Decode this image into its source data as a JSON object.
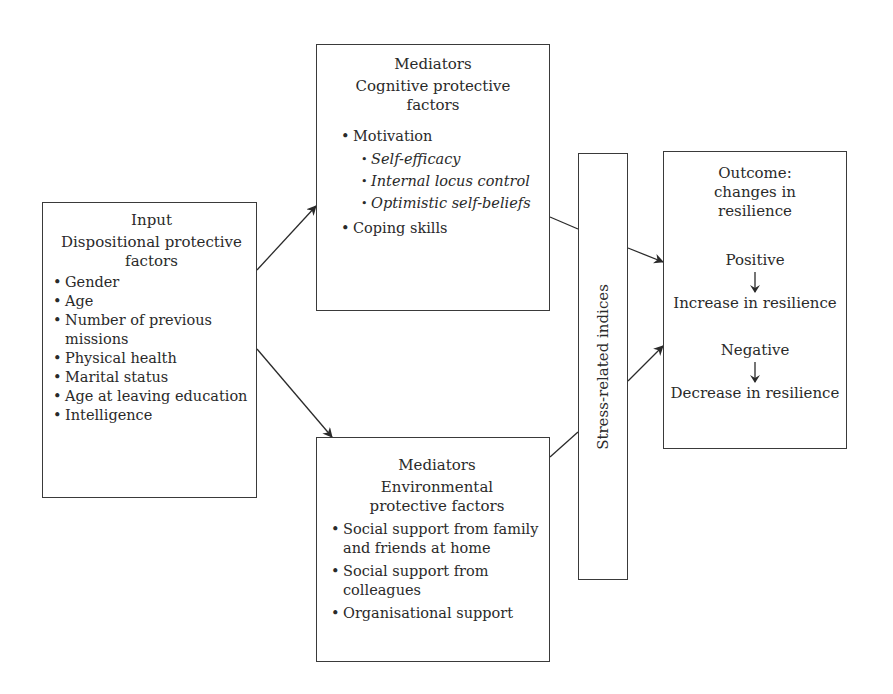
{
  "input": {
    "title": "Input",
    "subtitle": "Dispositional protective factors",
    "items": [
      "Gender",
      "Age",
      "Number of previous missions",
      "Physical health",
      "Marital status",
      "Age at leaving education",
      "Intelligence"
    ]
  },
  "cognitive": {
    "title": "Mediators",
    "subtitle": "Cognitive protective factors",
    "items": [
      {
        "label": "Motivation",
        "subitems": [
          "Self-efficacy",
          "Internal locus control",
          "Optimistic self-beliefs"
        ]
      },
      {
        "label": "Coping skills"
      }
    ]
  },
  "environmental": {
    "title": "Mediators",
    "subtitle": "Environmental protective factors",
    "items": [
      "Social support from family and friends at home",
      "Social support from colleagues",
      "Organisational support"
    ]
  },
  "stress": {
    "label": "Stress-related indices"
  },
  "outcome": {
    "title": "Outcome: changes in resilience",
    "positive": "Positive",
    "increase": "Increase in resilience",
    "negative": "Negative",
    "decrease": "Decrease in resilience"
  },
  "colors": {
    "line": "#2a2a2a",
    "border": "#3a3a3a",
    "background": "#ffffff"
  }
}
